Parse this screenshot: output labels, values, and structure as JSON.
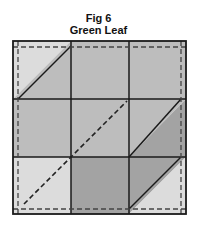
{
  "figure": {
    "number_label": "Fig 6",
    "title": "Green Leaf"
  },
  "block": {
    "grid": "3x3",
    "colors": {
      "light": "#dcdcdc",
      "medium": "#bdbdbd",
      "dark": "#a3a3a3",
      "line": "#1a1a1a",
      "seam": "#444444"
    },
    "cells": [
      {
        "row": 1,
        "col": 1,
        "type": "half-square-triangle",
        "diagonal": "bottom-left to top-right",
        "upper_left": "light",
        "lower_right": "medium"
      },
      {
        "row": 1,
        "col": 2,
        "type": "square",
        "fill": "medium"
      },
      {
        "row": 1,
        "col": 3,
        "type": "square",
        "fill": "medium"
      },
      {
        "row": 2,
        "col": 1,
        "type": "square",
        "fill": "medium"
      },
      {
        "row": 2,
        "col": 2,
        "type": "square",
        "fill": "medium"
      },
      {
        "row": 2,
        "col": 3,
        "type": "half-square-triangle",
        "diagonal": "bottom-left to top-right",
        "upper_left": "medium",
        "lower_right": "dark"
      },
      {
        "row": 3,
        "col": 1,
        "type": "square",
        "fill": "light"
      },
      {
        "row": 3,
        "col": 2,
        "type": "square",
        "fill": "dark"
      },
      {
        "row": 3,
        "col": 3,
        "type": "half-square-triangle",
        "diagonal": "bottom-left to top-right",
        "upper_left": "dark",
        "lower_right": "light"
      }
    ],
    "seam_allowance": "dashed inset line around block",
    "stem": "dashed diagonal from bottom-left corner to top-right of center square"
  }
}
